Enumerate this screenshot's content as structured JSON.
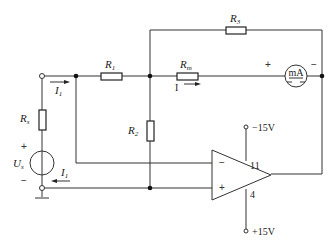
{
  "diagram": {
    "type": "circuit-schematic",
    "components": {
      "R1": {
        "label": "R",
        "sub": "1"
      },
      "R2": {
        "label": "R",
        "sub": "2"
      },
      "R3": {
        "label": "R",
        "sub": "3"
      },
      "Rm": {
        "label": "R",
        "sub": "m"
      },
      "Rs": {
        "label": "R",
        "sub": "s"
      },
      "Us": {
        "label": "U",
        "sub": "s",
        "plus": "+",
        "minus": "−"
      },
      "meter": {
        "label": "mA",
        "plus": "+",
        "minus": "−"
      },
      "opamp": {
        "inv": "−",
        "noninv": "+",
        "pin_top": "11",
        "pin_bottom": "4"
      }
    },
    "supplies": {
      "top": "−15V",
      "bottom": "+15V"
    },
    "currents": {
      "I1_top": {
        "label": "I",
        "sub": "1"
      },
      "I1_bottom": {
        "label": "I",
        "sub": "1"
      },
      "I": {
        "label": "I"
      }
    },
    "colors": {
      "line": "#333333",
      "background": "#ffffff"
    }
  }
}
